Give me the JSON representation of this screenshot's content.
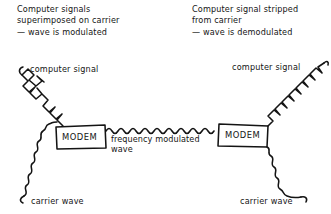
{
  "diagram": {
    "style": "hand-drawn sketch",
    "ink_color": "#141414",
    "background_color": "#ffffff",
    "annotations": {
      "top_left": "Computer signals\nsuperimposed on carrier\n— wave is modulated",
      "top_right": "Computer signal stripped\nfrom carrier\n— wave is demodulated"
    },
    "nodes": [
      {
        "id": "modem-left",
        "label": "MODEM"
      },
      {
        "id": "modem-right",
        "label": "MODEM"
      }
    ],
    "signal_labels": {
      "computer_signal_left": "computer signal",
      "computer_signal_right": "computer signal",
      "carrier_wave_left": "carrier wave",
      "carrier_wave_right": "carrier wave",
      "frequency_modulated_wave": "frequency modulated\nwave"
    },
    "waveforms": [
      {
        "id": "computer-signal-left-wave",
        "kind": "square",
        "description": "digital square wave entering left modem from upper left"
      },
      {
        "id": "carrier-wave-left-wave",
        "kind": "sine",
        "description": "analog sine carrier entering left modem from lower left"
      },
      {
        "id": "frequency-modulated-wave",
        "kind": "sine",
        "description": "dense frequency modulated sine wave between the two modems"
      },
      {
        "id": "computer-signal-right-wave",
        "kind": "square",
        "description": "digital square wave leaving right modem to upper right"
      },
      {
        "id": "carrier-wave-right-wave",
        "kind": "sine",
        "description": "analog sine carrier leaving right modem to lower right"
      }
    ]
  }
}
